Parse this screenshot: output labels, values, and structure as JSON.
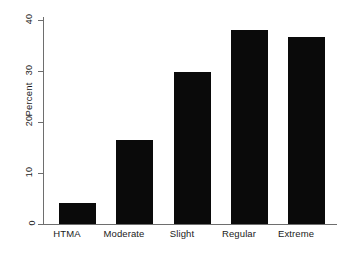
{
  "chart_data": {
    "type": "bar",
    "title": "",
    "subtitle": "",
    "xlabel": "",
    "ylabel": "Percent",
    "categories": [
      "HTMA",
      "Moderate",
      "Slight",
      "Regular",
      "Extreme"
    ],
    "values": [
      4.0,
      16.2,
      29.3,
      37.5,
      36.1
    ],
    "series": [
      {
        "name": "Percent",
        "values": [
          4.0,
          16.2,
          29.3,
          37.5,
          36.1
        ]
      }
    ],
    "ylim": [
      0,
      40
    ],
    "yticks": [
      0,
      10,
      20,
      30,
      40
    ],
    "ytick_labels": [
      "0",
      "10",
      "20",
      "30",
      "40"
    ],
    "grid": false,
    "legend": false,
    "legend_position": "none",
    "bar_color": "#0a0a0a",
    "axis_color": "#6e6e6e",
    "background_color": "#ffffff",
    "annotations": []
  },
  "axes": {
    "y_title": "Percent",
    "y_ticks": [
      {
        "label": "40",
        "value": 40
      },
      {
        "label": "30",
        "value": 30
      },
      {
        "label": "20",
        "value": 20
      },
      {
        "label": "10",
        "value": 10
      },
      {
        "label": "0",
        "value": 0
      }
    ],
    "x_ticks": [
      {
        "label": "HTMA"
      },
      {
        "label": "Moderate"
      },
      {
        "label": "Slight"
      },
      {
        "label": "Regular"
      },
      {
        "label": "Extreme"
      }
    ]
  }
}
